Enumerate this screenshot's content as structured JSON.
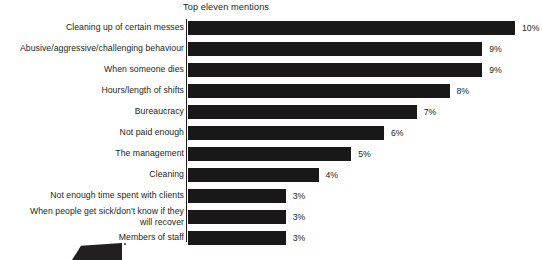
{
  "chart": {
    "title": "Top eleven mentions",
    "value_suffix": "%"
  },
  "chart_data": {
    "type": "bar",
    "orientation": "horizontal",
    "title": "Top eleven mentions",
    "xlabel": "",
    "ylabel": "",
    "xlim": [
      0,
      10
    ],
    "grid": false,
    "legend": null,
    "categories": [
      "Cleaning up of certain messes",
      "Abusive/aggressive/challenging behaviour",
      "When someone dies",
      "Hours/length of shifts",
      "Bureaucracy",
      "Not paid enough",
      "The management",
      "Cleaning",
      "Not enough time spent with clients",
      "When people get sick/don't know if they will recover",
      "Members of staff"
    ],
    "values": [
      10,
      9,
      9,
      8,
      7,
      6,
      5,
      4,
      3,
      3,
      3
    ],
    "value_labels": [
      "10%",
      "9%",
      "9%",
      "8%",
      "7%",
      "6%",
      "5%",
      "4%",
      "3%",
      "3%",
      "3%"
    ],
    "bars": [
      {
        "label": "Cleaning up of certain messes",
        "value": 10,
        "value_label": "10%",
        "label_lines": [
          "Cleaning up of certain messes"
        ]
      },
      {
        "label": "Abusive/aggressive/challenging behaviour",
        "value": 9,
        "value_label": "9%",
        "label_lines": [
          "Abusive/aggressive/challenging behaviour"
        ]
      },
      {
        "label": "When someone dies",
        "value": 9,
        "value_label": "9%",
        "label_lines": [
          "When someone dies"
        ]
      },
      {
        "label": "Hours/length of shifts",
        "value": 8,
        "value_label": "8%",
        "label_lines": [
          "Hours/length of shifts"
        ]
      },
      {
        "label": "Bureaucracy",
        "value": 7,
        "value_label": "7%",
        "label_lines": [
          "Bureaucracy"
        ]
      },
      {
        "label": "Not paid enough",
        "value": 6,
        "value_label": "6%",
        "label_lines": [
          "Not paid enough"
        ]
      },
      {
        "label": "The management",
        "value": 5,
        "value_label": "5%",
        "label_lines": [
          "The management"
        ]
      },
      {
        "label": "Cleaning",
        "value": 4,
        "value_label": "4%",
        "label_lines": [
          "Cleaning"
        ]
      },
      {
        "label": "Not enough time spent with clients",
        "value": 3,
        "value_label": "3%",
        "label_lines": [
          "Not enough time spent with clients"
        ]
      },
      {
        "label": "When people get sick/don't know if they will recover",
        "value": 3,
        "value_label": "3%",
        "label_lines": [
          "When people get sick/don't know if they",
          "will recover"
        ]
      },
      {
        "label": "Members of staff",
        "value": 3,
        "value_label": "3%",
        "label_lines": [
          "Members of staff"
        ]
      }
    ],
    "colors": {
      "bar": "#1a1718",
      "text": "#231f20",
      "background": "#ffffff"
    }
  }
}
